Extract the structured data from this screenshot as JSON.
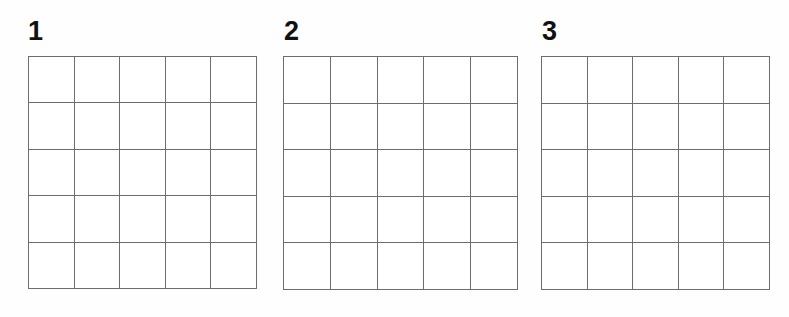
{
  "page": {
    "background_color": "#ffffff",
    "line_color": "#6d6d6d",
    "border_color": "#3a3a3a",
    "label_color": "#111111"
  },
  "grids": [
    {
      "label": "1",
      "rows": 5,
      "columns": 5,
      "cells": [
        [
          "",
          "",
          "",
          "",
          ""
        ],
        [
          "",
          "",
          "",
          "",
          ""
        ],
        [
          "",
          "",
          "",
          "",
          ""
        ],
        [
          "",
          "",
          "",
          "",
          ""
        ],
        [
          "",
          "",
          "",
          "",
          ""
        ]
      ]
    },
    {
      "label": "2",
      "rows": 5,
      "columns": 5,
      "cells": [
        [
          "",
          "",
          "",
          "",
          ""
        ],
        [
          "",
          "",
          "",
          "",
          ""
        ],
        [
          "",
          "",
          "",
          "",
          ""
        ],
        [
          "",
          "",
          "",
          "",
          ""
        ],
        [
          "",
          "",
          "",
          "",
          ""
        ]
      ]
    },
    {
      "label": "3",
      "rows": 5,
      "columns": 5,
      "cells": [
        [
          "",
          "",
          "",
          "",
          ""
        ],
        [
          "",
          "",
          "",
          "",
          ""
        ],
        [
          "",
          "",
          "",
          "",
          ""
        ],
        [
          "",
          "",
          "",
          "",
          ""
        ],
        [
          "",
          "",
          "",
          "",
          ""
        ]
      ]
    }
  ]
}
